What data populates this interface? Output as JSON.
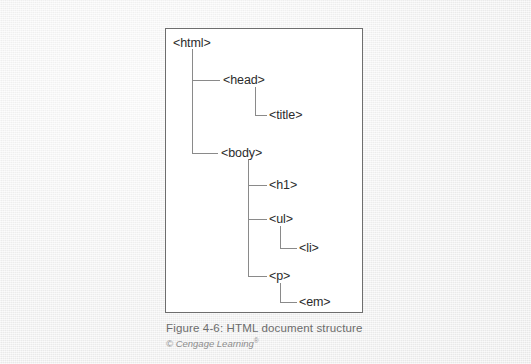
{
  "figure": {
    "caption_title": "Figure 4-6: HTML document structure",
    "caption_credit": "© Cengage Learning",
    "caption_credit_mark": "®",
    "frame_color": "#6e6e6e",
    "line_color": "#8a8a8a",
    "text_color": "#2b2b2b",
    "page_background": "#f1f1f1"
  },
  "tree": {
    "title": "HTML document structure",
    "type": "hierarchy",
    "nodes": [
      {
        "id": "html",
        "label": "<html>",
        "depth": 0,
        "parent": null,
        "x": 172,
        "y": 35
      },
      {
        "id": "head",
        "label": "<head>",
        "depth": 1,
        "parent": "html",
        "x": 222,
        "y": 76
      },
      {
        "id": "title",
        "label": "<title>",
        "depth": 2,
        "parent": "head",
        "x": 268,
        "y": 108
      },
      {
        "id": "body",
        "label": "<body>",
        "depth": 1,
        "parent": "html",
        "x": 220,
        "y": 146
      },
      {
        "id": "h1",
        "label": "<h1>",
        "depth": 2,
        "parent": "body",
        "x": 268,
        "y": 178
      },
      {
        "id": "ul",
        "label": "<ul>",
        "depth": 2,
        "parent": "body",
        "x": 268,
        "y": 212
      },
      {
        "id": "li",
        "label": "<li>",
        "depth": 3,
        "parent": "ul",
        "x": 300,
        "y": 237
      },
      {
        "id": "p",
        "label": "<p>",
        "depth": 2,
        "parent": "body",
        "x": 268,
        "y": 265
      },
      {
        "id": "em",
        "label": "<em>",
        "depth": 3,
        "parent": "p",
        "x": 300,
        "y": 291
      }
    ]
  }
}
